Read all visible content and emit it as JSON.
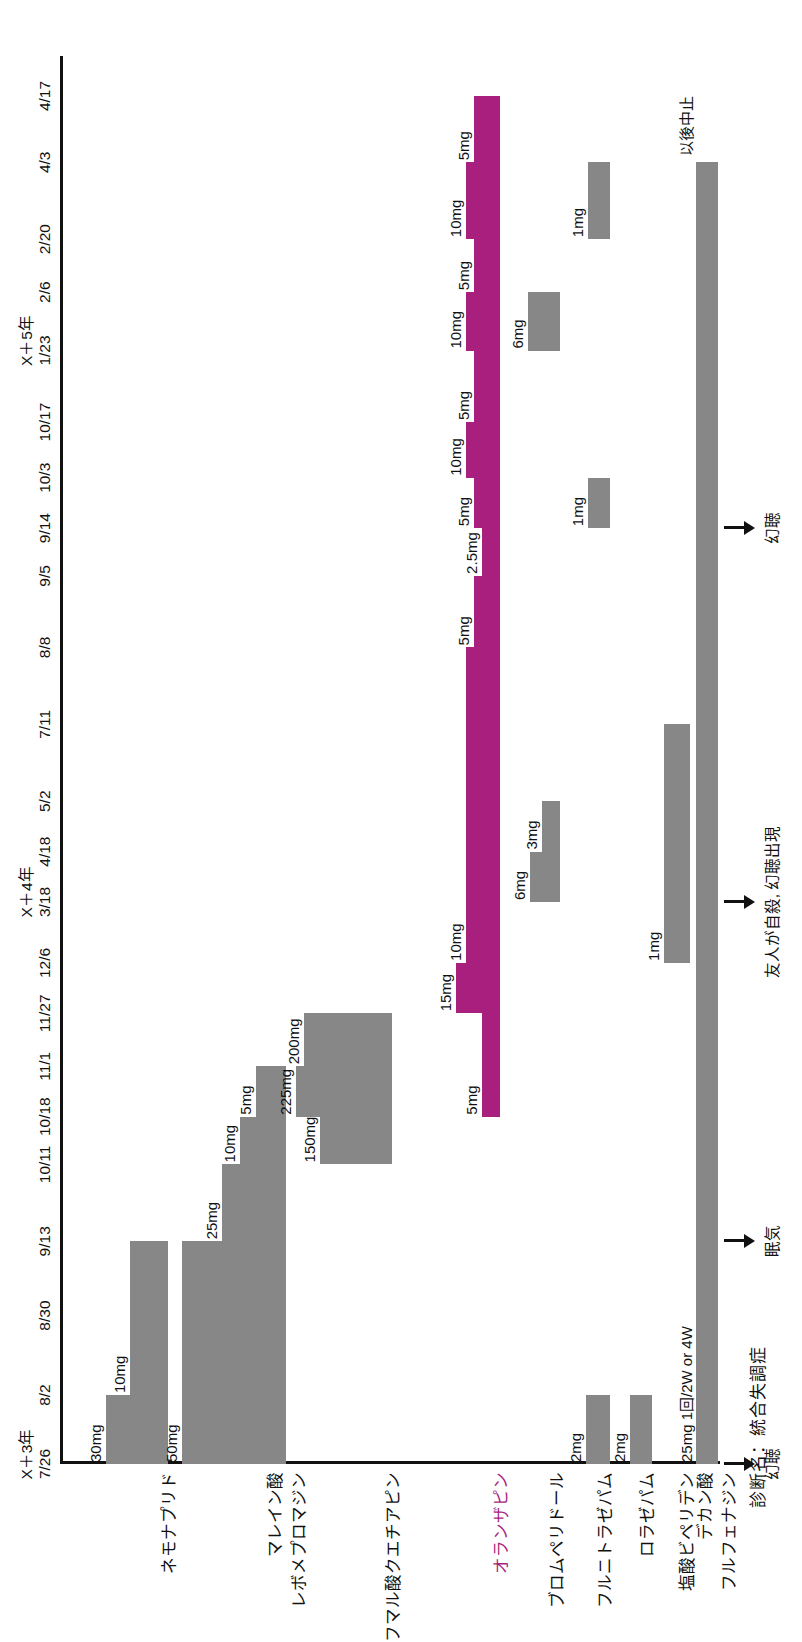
{
  "diagnosis_label": "診断名：統合失調症",
  "chart_data": {
    "type": "table",
    "title": "診断名：統合失調症",
    "xlabel": "",
    "ylabel": "",
    "grid": false,
    "legend": "none",
    "axis_years": [
      {
        "label": "X＋3年",
        "at_tick": "7/26"
      },
      {
        "label": "X＋4年",
        "at_tick": "3/18"
      },
      {
        "label": "X＋5年",
        "at_tick": "1/23"
      }
    ],
    "tick_labels": [
      "7/26",
      "8/2",
      "8/30",
      "9/13",
      "10/11",
      "10/18",
      "11/1",
      "11/27",
      "12/6",
      "3/18",
      "4/18",
      "5/2",
      "7/11",
      "8/8",
      "9/5",
      "9/14",
      "10/3",
      "10/17",
      "1/23",
      "2/6",
      "2/20",
      "4/3",
      "4/17"
    ],
    "series": [
      {
        "name": "ネモナプリド",
        "color": "#878787",
        "segments": [
          {
            "dose": "30mg",
            "start": "7/26",
            "end": "8/2"
          },
          {
            "dose": "10mg",
            "start": "8/2",
            "end": "9/13"
          }
        ]
      },
      {
        "name": "マレイン酸\nレボメプロマジン",
        "color": "#878787",
        "segments": [
          {
            "dose": "50mg",
            "start": "7/26",
            "end": "9/13"
          },
          {
            "dose": "25mg",
            "start": "9/13",
            "end": "10/11"
          },
          {
            "dose": "10mg",
            "start": "10/11",
            "end": "10/18"
          },
          {
            "dose": "5mg",
            "start": "10/18",
            "end": "11/1"
          }
        ]
      },
      {
        "name": "フマル酸クエチアピン",
        "color": "#878787",
        "segments": [
          {
            "dose": "150mg",
            "start": "10/11",
            "end": "10/18"
          },
          {
            "dose": "225mg",
            "start": "10/18",
            "end": "11/1"
          },
          {
            "dose": "200mg",
            "start": "11/1",
            "end": "11/27"
          }
        ]
      },
      {
        "name": "オランザピン",
        "color": "#a81f7e",
        "segments": [
          {
            "dose": "5mg",
            "start": "10/18",
            "end": "11/27"
          },
          {
            "dose": "15mg",
            "start": "11/27",
            "end": "12/6"
          },
          {
            "dose": "10mg",
            "start": "12/6",
            "end": "8/8"
          },
          {
            "dose": "5mg",
            "start": "8/8",
            "end": "9/5"
          },
          {
            "dose": "2.5mg",
            "start": "9/5",
            "end": "9/14"
          },
          {
            "dose": "5mg",
            "start": "9/14",
            "end": "10/3"
          },
          {
            "dose": "10mg",
            "start": "10/3",
            "end": "10/17"
          },
          {
            "dose": "5mg",
            "start": "10/17",
            "end": "1/23"
          },
          {
            "dose": "10mg",
            "start": "1/23",
            "end": "2/6"
          },
          {
            "dose": "5mg",
            "start": "2/6",
            "end": "2/20"
          },
          {
            "dose": "10mg",
            "start": "2/20",
            "end": "4/3"
          },
          {
            "dose": "5mg",
            "start": "4/3",
            "end": "4/17"
          }
        ]
      },
      {
        "name": "ブロムペリドール",
        "color": "#878787",
        "segments": [
          {
            "dose": "6mg",
            "start": "3/18",
            "end": "4/18"
          },
          {
            "dose": "3mg",
            "start": "4/18",
            "end": "5/2"
          },
          {
            "dose": "6mg",
            "start": "1/23",
            "end": "2/6"
          }
        ]
      },
      {
        "name": "フルニトラゼパム",
        "color": "#878787",
        "segments": [
          {
            "dose": "2mg",
            "start": "7/26",
            "end": "8/2"
          },
          {
            "dose": "1mg",
            "start": "9/14",
            "end": "10/3"
          },
          {
            "dose": "1mg",
            "start": "2/20",
            "end": "4/3"
          }
        ]
      },
      {
        "name": "ロラゼパム",
        "color": "#878787",
        "segments": [
          {
            "dose": "2mg",
            "start": "7/26",
            "end": "8/2"
          }
        ]
      },
      {
        "name": "塩酸ビペリデン",
        "color": "#878787",
        "segments": [
          {
            "dose": "1mg",
            "start": "12/6",
            "end": "7/11"
          }
        ]
      },
      {
        "name": "デカン酸\nフルフェナジン",
        "color": "#878787",
        "segments": [
          {
            "dose": "25mg 1回/2W or 4W",
            "start": "7/26",
            "end": "4/3"
          },
          {
            "dose": "以後中止",
            "start": "4/3",
            "end": "4/3"
          }
        ]
      }
    ],
    "event_annotations": [
      {
        "text": "幻聴",
        "at_tick": "7/26"
      },
      {
        "text": "眠気",
        "at_tick": "9/13"
      },
      {
        "text": "友人が自殺, 幻聴出現",
        "at_tick": "3/18"
      },
      {
        "text": "幻聴",
        "at_tick": "9/14"
      }
    ]
  },
  "row_labels": [
    "ネモナプリド",
    "マレイン酸",
    "レボメプロマジン",
    "フマル酸クエチアピン",
    "オランザピン",
    "ブロムペリドール",
    "フルニトラゼパム",
    "ロラゼパム",
    "塩酸ビペリデン",
    "デカン酸",
    "フルフェナジン"
  ],
  "doses": {
    "nemonapride": [
      "30mg",
      "10mg"
    ],
    "levomepromazine": [
      "50mg",
      "25mg",
      "10mg",
      "5mg"
    ],
    "quetiapine": [
      "150mg",
      "225mg",
      "200mg"
    ],
    "olanzapine": [
      "5mg",
      "15mg",
      "10mg",
      "5mg",
      "2.5mg",
      "5mg",
      "10mg",
      "5mg",
      "10mg",
      "5mg",
      "10mg",
      "5mg"
    ],
    "bromperidol": [
      "6mg",
      "3mg",
      "6mg"
    ],
    "flunitrazepam": [
      "2mg",
      "1mg",
      "1mg"
    ],
    "lorazepam": [
      "2mg"
    ],
    "biperiden": [
      "1mg"
    ],
    "fluphenazine": [
      "25mg 1回/2W or 4W",
      "以後中止"
    ]
  },
  "annotations": {
    "a1": "幻聴",
    "a2": "眠気",
    "a3": "友人が自殺, 幻聴出現",
    "a4": "幻聴"
  },
  "years": {
    "y1": "X＋3年",
    "y2": "X＋4年",
    "y3": "X＋5年"
  },
  "ticks": [
    "7/26",
    "8/2",
    "8/30",
    "9/13",
    "10/11",
    "10/18",
    "11/1",
    "11/27",
    "12/6",
    "3/18",
    "4/18",
    "5/2",
    "7/11",
    "8/8",
    "9/5",
    "9/14",
    "10/3",
    "10/17",
    "1/23",
    "2/6",
    "2/20",
    "4/3",
    "4/17"
  ],
  "colors": {
    "bar_gray": "#878787",
    "bar_magenta": "#a81f7e",
    "axis": "#111111"
  }
}
